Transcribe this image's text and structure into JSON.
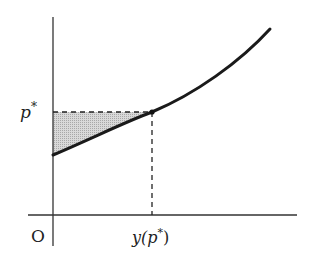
{
  "diagram": {
    "origin_label": "O",
    "y_axis_label": "p",
    "y_axis_label_sup": "*",
    "x_axis_label_prefix": "y(",
    "x_axis_label_var": "p",
    "x_axis_label_sup": "*",
    "x_axis_label_suffix": ")",
    "colors": {
      "axis": "#333333",
      "curve": "#1a1a1a",
      "shade": "#c8c8c8",
      "dash": "#222222"
    },
    "geometry": {
      "origin": [
        53,
        215
      ],
      "point": [
        152,
        112
      ],
      "curve_start": [
        53,
        155
      ],
      "curve_end": [
        270,
        29
      ]
    }
  }
}
